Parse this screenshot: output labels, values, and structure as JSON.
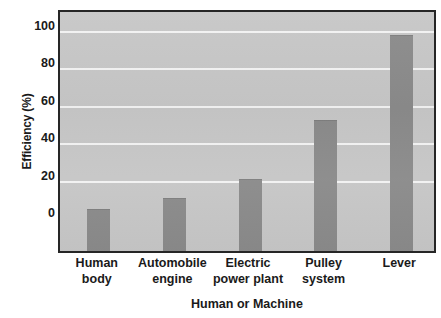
{
  "chart_data": {
    "type": "bar",
    "title": "",
    "xlabel": "Human or Machine",
    "ylabel": "Efficiency (%)",
    "categories": [
      "Human body",
      "Automobile engine",
      "Electric power plant",
      "Pulley system",
      "Lever"
    ],
    "category_lines": [
      [
        "Human",
        "body"
      ],
      [
        "Automobile",
        "engine"
      ],
      [
        "Electric",
        "power plant"
      ],
      [
        "Pulley",
        "system"
      ],
      [
        "Lever"
      ]
    ],
    "values": [
      3,
      9,
      19,
      51,
      96
    ],
    "ylim": [
      0,
      110
    ],
    "yticks": [
      0,
      20,
      40,
      60,
      80,
      100
    ],
    "ytick_labels": [
      "0",
      "20",
      "40",
      "60",
      "80",
      "100"
    ],
    "gridlines": [
      20,
      40,
      60,
      80,
      100
    ],
    "grid": true,
    "legend": "none",
    "colors": {
      "bar": "#8a8a8a",
      "plot_background": "#c6c6c6",
      "gridline": "#f2f2f2",
      "axis": "#262626",
      "text": "#1a1a1a",
      "page_background": "#ffffff"
    }
  }
}
